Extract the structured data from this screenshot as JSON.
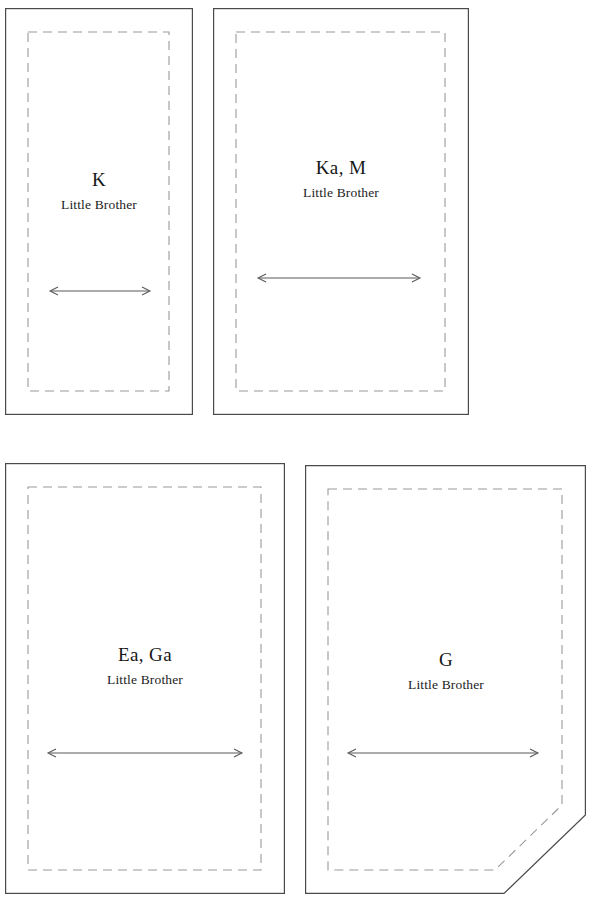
{
  "figure": {
    "type": "architectural-plan-diagram",
    "background_color": "#ffffff",
    "outline_color": "#4a4a4a",
    "dashed_color": "#9a9a9a",
    "arrow_color": "#5a5a5a",
    "text_color": "#171717"
  },
  "panels": [
    {
      "id": "panel-k",
      "code": "K",
      "subtitle": "Little Brother",
      "shape": "rectangle",
      "outer": {
        "x": 5,
        "y": 8,
        "width": 188,
        "height": 407
      },
      "dashed_inset": 23,
      "arrow": {
        "y": 291,
        "x1": 50,
        "x2": 148
      },
      "label_top": 170
    },
    {
      "id": "panel-ka-m",
      "code": "Ka, M",
      "subtitle": "Little Brother",
      "shape": "rectangle",
      "outer": {
        "x": 213,
        "y": 8,
        "width": 256,
        "height": 407
      },
      "dashed_inset": 23,
      "arrow": {
        "y": 278,
        "x1": 258,
        "x2": 418
      },
      "label_top": 158
    },
    {
      "id": "panel-ea-ga",
      "code": "Ea, Ga",
      "subtitle": "Little Brother",
      "shape": "rectangle",
      "outer": {
        "x": 5,
        "y": 463,
        "width": 280,
        "height": 431
      },
      "dashed_inset": 23,
      "arrow": {
        "y": 753,
        "x1": 48,
        "x2": 240
      },
      "label_top": 645
    },
    {
      "id": "panel-g",
      "code": "G",
      "subtitle": "Little Brother",
      "shape": "chamfered-bottom-right",
      "outer": {
        "x": 305,
        "y": 465,
        "width": 282,
        "height": 429
      },
      "dashed_inset": 23,
      "chamfer": {
        "start_y": 815,
        "end_x": 504
      },
      "arrow": {
        "y": 753,
        "x1": 348,
        "x2": 536
      },
      "label_top": 650
    }
  ]
}
